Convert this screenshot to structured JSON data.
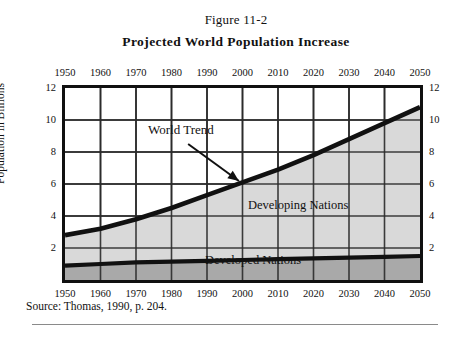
{
  "figure": {
    "number": "Figure 11-2",
    "title": "Projected World Population Increase",
    "source": "Source: Thomas, 1990, p. 204."
  },
  "colors": {
    "developing_fill": "#d9d9d9",
    "developed_fill": "#a9a9a9",
    "line": "#111111",
    "grid": "#2b2b2b",
    "frame": "#101010"
  },
  "chart_data": {
    "type": "area",
    "title": "Projected World Population Increase",
    "xlabel": "",
    "ylabel": "Population in Billions",
    "xlim": [
      1950,
      2050
    ],
    "ylim": [
      0,
      12
    ],
    "grid": true,
    "legend": "inline-annotations",
    "x": [
      1950,
      1960,
      1970,
      1980,
      1990,
      2000,
      2010,
      2020,
      2030,
      2040,
      2050
    ],
    "xticks": [
      "1950",
      "1960",
      "1970",
      "1980",
      "1990",
      "2000",
      "2010",
      "2020",
      "2030",
      "2040",
      "2050"
    ],
    "yticks": [
      "2",
      "4",
      "6",
      "8",
      "10",
      "12"
    ],
    "series": [
      {
        "name": "World Trend",
        "values": [
          2.8,
          3.2,
          3.8,
          4.5,
          5.3,
          6.1,
          6.9,
          7.8,
          8.8,
          9.8,
          10.8
        ]
      },
      {
        "name": "Developed Nations",
        "values": [
          0.9,
          1.0,
          1.1,
          1.15,
          1.2,
          1.25,
          1.3,
          1.35,
          1.4,
          1.45,
          1.5
        ]
      },
      {
        "name": "Developing Nations",
        "values": [
          1.9,
          2.2,
          2.7,
          3.35,
          4.1,
          4.85,
          5.6,
          6.45,
          7.4,
          8.35,
          9.3
        ]
      }
    ],
    "annotations": [
      {
        "text": "World Trend",
        "x": 1985,
        "y": 8.4,
        "arrow_to": {
          "x": 1999,
          "y": 6.0
        }
      },
      {
        "text": "Developing Nations",
        "x": 2013,
        "y": 4.5
      },
      {
        "text": "Developed Nations",
        "x": 1997,
        "y": 0.9
      }
    ]
  }
}
